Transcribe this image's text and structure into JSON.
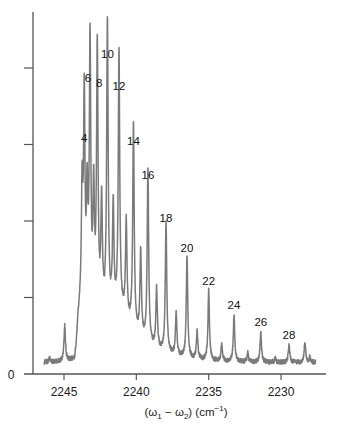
{
  "chart_data": {
    "type": "line",
    "title": "",
    "xlabel": "(ω₁ − ω₂) (cm⁻¹)",
    "xlabel_parts": {
      "open": "(",
      "w1": "ω",
      "sub1": "1",
      "minus": " − ",
      "w2": "ω",
      "sub2": "2",
      "mid": ") (cm",
      "sup": "−1",
      "close": ")"
    },
    "ylabel": "",
    "xlim": [
      2246.4,
      2227.6
    ],
    "ylim": [
      0,
      4.6
    ],
    "x_reversed": true,
    "x_ticks": [
      2245,
      2240,
      2235,
      2230
    ],
    "x_tick_labels": [
      "2245",
      "2240",
      "2235",
      "2230"
    ],
    "y_ticks": [
      0,
      1,
      2,
      3,
      4
    ],
    "y_tick_labels": [
      "0",
      "",
      "",
      "",
      ""
    ],
    "grid": false,
    "legend": null,
    "line_color": "#7a7a7a",
    "axis_color": "#555555",
    "baseline": 0.15,
    "labeled_peaks": [
      {
        "label": "4",
        "x": 2243.6,
        "y": 2.95
      },
      {
        "label": "6",
        "x": 2243.2,
        "y": 3.74
      },
      {
        "label": "8",
        "x": 2242.7,
        "y": 3.67
      },
      {
        "label": "10",
        "x": 2242.0,
        "y": 4.05
      },
      {
        "label": "12",
        "x": 2241.2,
        "y": 3.63
      },
      {
        "label": "14",
        "x": 2240.2,
        "y": 2.92
      },
      {
        "label": "16",
        "x": 2239.2,
        "y": 2.47
      },
      {
        "label": "18",
        "x": 2237.95,
        "y": 1.91
      },
      {
        "label": "20",
        "x": 2236.5,
        "y": 1.52
      },
      {
        "label": "22",
        "x": 2235.0,
        "y": 1.09
      },
      {
        "label": "24",
        "x": 2233.25,
        "y": 0.77
      },
      {
        "label": "26",
        "x": 2231.4,
        "y": 0.55
      },
      {
        "label": "28",
        "x": 2229.45,
        "y": 0.38
      }
    ],
    "unlabeled_peaks": [
      {
        "x": 2246.0,
        "y": 0.2
      },
      {
        "x": 2244.95,
        "y": 0.62
      },
      {
        "x": 2243.75,
        "y": 1.7
      },
      {
        "x": 2243.4,
        "y": 1.55
      },
      {
        "x": 2242.95,
        "y": 1.7
      },
      {
        "x": 2242.4,
        "y": 1.6
      },
      {
        "x": 2241.6,
        "y": 1.55
      },
      {
        "x": 2240.7,
        "y": 1.45
      },
      {
        "x": 2239.7,
        "y": 1.3
      },
      {
        "x": 2238.6,
        "y": 0.95
      },
      {
        "x": 2237.25,
        "y": 0.72
      },
      {
        "x": 2235.8,
        "y": 0.52
      },
      {
        "x": 2234.1,
        "y": 0.38
      },
      {
        "x": 2232.3,
        "y": 0.27
      },
      {
        "x": 2230.4,
        "y": 0.2
      },
      {
        "x": 2228.35,
        "y": 0.42
      },
      {
        "x": 2228.0,
        "y": 0.22
      }
    ],
    "plateau": {
      "start": 2244.1,
      "end": 2241.0,
      "level": 0.85
    }
  },
  "axes": {
    "y_zero_label": "0"
  }
}
